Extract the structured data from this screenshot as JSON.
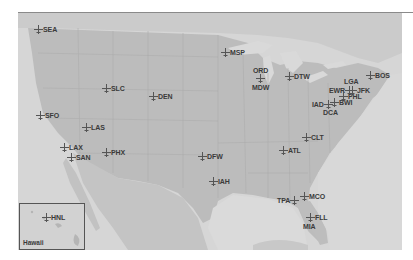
{
  "map": {
    "title": "",
    "colors": {
      "land": "#b9b9b9",
      "land_light": "#c6c6c6",
      "water": "#d9d9d9",
      "border": "#a9a9a9",
      "label": "#3a3a3a"
    },
    "airports": [
      {
        "code": "SEA",
        "x": 38,
        "y": 30,
        "label_pos": "right"
      },
      {
        "code": "MSP",
        "x": 226,
        "y": 53,
        "label_pos": "right"
      },
      {
        "code": "ORD",
        "x": 261,
        "y": 71,
        "label_pos": "above"
      },
      {
        "code": "MDW",
        "x": 261,
        "y": 88,
        "label_pos": "below"
      },
      {
        "code": "DTW",
        "x": 289,
        "y": 77,
        "label_pos": "right"
      },
      {
        "code": "BOS",
        "x": 370,
        "y": 75,
        "label_pos": "right"
      },
      {
        "code": "LGA",
        "x": 351,
        "y": 82,
        "label_pos": "above"
      },
      {
        "code": "EWR",
        "x": 345,
        "y": 90,
        "label_pos": "left"
      },
      {
        "code": "JFK",
        "x": 352,
        "y": 90,
        "label_pos": "right"
      },
      {
        "code": "PHL",
        "x": 343,
        "y": 96,
        "label_pos": "right"
      },
      {
        "code": "IAD",
        "x": 328,
        "y": 104,
        "label_pos": "left"
      },
      {
        "code": "BWI",
        "x": 334,
        "y": 102,
        "label_pos": "right"
      },
      {
        "code": "DCA",
        "x": 331,
        "y": 113,
        "label_pos": "below"
      },
      {
        "code": "SLC",
        "x": 106,
        "y": 88,
        "label_pos": "right"
      },
      {
        "code": "DEN",
        "x": 153,
        "y": 97,
        "label_pos": "right"
      },
      {
        "code": "SFO",
        "x": 40,
        "y": 115,
        "label_pos": "right"
      },
      {
        "code": "LAS",
        "x": 86,
        "y": 127,
        "label_pos": "right"
      },
      {
        "code": "LAX",
        "x": 64,
        "y": 147,
        "label_pos": "right"
      },
      {
        "code": "SAN",
        "x": 71,
        "y": 157,
        "label_pos": "right"
      },
      {
        "code": "PHX",
        "x": 106,
        "y": 152,
        "label_pos": "right"
      },
      {
        "code": "DFW",
        "x": 202,
        "y": 156,
        "label_pos": "right"
      },
      {
        "code": "CLT",
        "x": 306,
        "y": 137,
        "label_pos": "right"
      },
      {
        "code": "ATL",
        "x": 283,
        "y": 150,
        "label_pos": "right"
      },
      {
        "code": "IAH",
        "x": 213,
        "y": 181,
        "label_pos": "right"
      },
      {
        "code": "TPA",
        "x": 295,
        "y": 200,
        "label_pos": "left"
      },
      {
        "code": "MCO",
        "x": 304,
        "y": 196,
        "label_pos": "right"
      },
      {
        "code": "FLL",
        "x": 310,
        "y": 217,
        "label_pos": "right"
      },
      {
        "code": "MIA",
        "x": 309,
        "y": 226,
        "label_pos": "below"
      }
    ],
    "inset": {
      "label": "Hawaii",
      "airports": [
        {
          "code": "HNL",
          "x": 45,
          "y": 217,
          "label_pos": "right"
        }
      ]
    }
  }
}
